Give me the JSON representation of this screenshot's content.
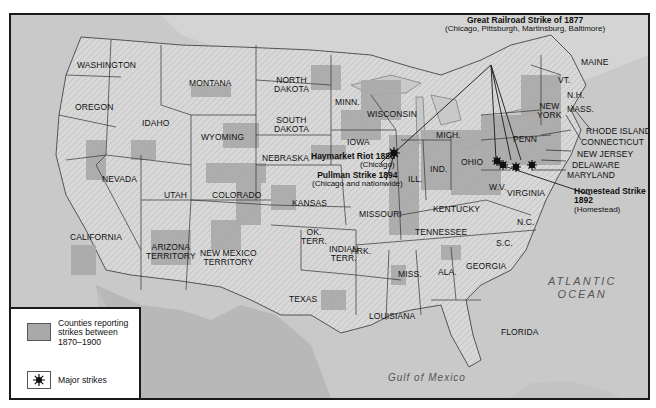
{
  "map": {
    "title": "Labor strikes in the United States, 1870–1900",
    "colors": {
      "water": "#c9c9c9",
      "land": "#dcdcdc",
      "strike_counties": "#a9a9a9",
      "border": "#333333",
      "frame": "#1a1a1a"
    },
    "water_labels": {
      "pacific": [
        "PACIFIC",
        "OCEAN"
      ],
      "atlantic": [
        "ATLANTIC",
        "OCEAN"
      ],
      "gulf": "Gulf of Mexico"
    },
    "states": [
      "WASHINGTON",
      "OREGON",
      "CALIFORNIA",
      "NEVADA",
      "IDAHO",
      "MONTANA",
      "WYOMING",
      "UTAH",
      "COLORADO",
      "ARIZONA TERRITORY",
      "NEW MEXICO TERRITORY",
      "NORTH DAKOTA",
      "SOUTH DAKOTA",
      "NEBRASKA",
      "KANSAS",
      "OK. TERR.",
      "INDIAN TERR.",
      "TEXAS",
      "MINN.",
      "IOWA",
      "MISSOURI",
      "ARK.",
      "LOUISIANA",
      "WISCONSIN",
      "ILL.",
      "MICH.",
      "IND.",
      "OHIO",
      "KENTUCKY",
      "TENNESSEE",
      "MISS.",
      "ALA.",
      "GEORGIA",
      "FLORIDA",
      "S.C.",
      "N.C.",
      "VIRGINIA",
      "W.V.",
      "PENN",
      "NEW YORK",
      "VT.",
      "N.H.",
      "MAINE",
      "MASS.",
      "RHODE ISLAND",
      "CONNECTICUT",
      "NEW JERSEY",
      "DELAWARE",
      "MARYLAND"
    ],
    "labels": {
      "washington": "WASHINGTON",
      "oregon": "OREGON",
      "california": "CALIFORNIA",
      "nevada": "NEVADA",
      "idaho": "IDAHO",
      "montana": "MONTANA",
      "wyoming": "WYOMING",
      "utah": "UTAH",
      "colorado": "COLORADO",
      "arizona": [
        "ARIZONA",
        "TERRITORY"
      ],
      "new_mexico": [
        "NEW MEXICO",
        "TERRITORY"
      ],
      "north_dakota": [
        "NORTH",
        "DAKOTA"
      ],
      "south_dakota": [
        "SOUTH",
        "DAKOTA"
      ],
      "nebraska": "NEBRASKA",
      "kansas": "KANSAS",
      "ok_terr": [
        "OK.",
        "TERR."
      ],
      "indian_terr": [
        "INDIAN",
        "TERR."
      ],
      "texas": "TEXAS",
      "minn": "MINN.",
      "iowa": "IOWA",
      "missouri": "MISSOURI",
      "ark": "ARK.",
      "louisiana": "LOUISIANA",
      "wisconsin": "WISCONSIN",
      "ill": "ILL.",
      "mich": "MICH.",
      "ind": "IND.",
      "ohio": "OHIO",
      "kentucky": "KENTUCKY",
      "tennessee": "TENNESSEE",
      "miss": "MISS.",
      "ala": "ALA.",
      "georgia": "GEORGIA",
      "florida": "FLORIDA",
      "sc": "S.C.",
      "nc": "N.C.",
      "virginia": "VIRGINIA",
      "wv": "W.V.",
      "penn": "PENN",
      "new_york": [
        "NEW",
        "YORK"
      ],
      "vt": "VT.",
      "nh": "N.H.",
      "maine": "MAINE",
      "mass": "MASS.",
      "rhode_island": "RHODE ISLAND",
      "connecticut": "CONNECTICUT",
      "new_jersey": "NEW JERSEY",
      "delaware": "DELAWARE",
      "maryland": "MARYLAND"
    },
    "strikes": [
      {
        "name": "Great Railroad Strike of 1877",
        "detail": "(Chicago, Pittsburgh, Martinsburg, Baltimore)"
      },
      {
        "name": "Haymarket Riot 1886",
        "detail": "(Chicago)"
      },
      {
        "name": "Pullman Strike 1894",
        "detail": "(Chicago and nationwide)"
      },
      {
        "name": "Homestead Strike",
        "name2": "1892",
        "detail": "(Homestead)"
      }
    ]
  },
  "legend": {
    "items": [
      {
        "label": "Counties reporting strikes between 1870–1900",
        "lines": [
          "Counties reporting",
          "strikes between",
          "1870–1900"
        ]
      },
      {
        "label": "Major strikes"
      }
    ]
  }
}
